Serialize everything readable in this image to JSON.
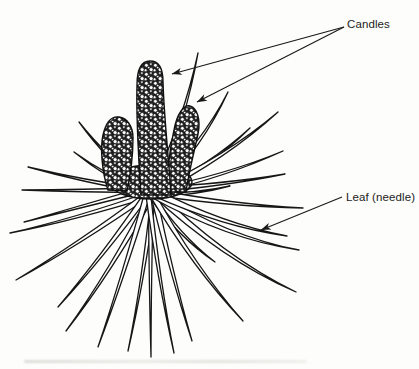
{
  "diagram": {
    "callouts": [
      {
        "label": "Candles",
        "arrow_count": 2
      },
      {
        "label": "Leaf (needle)",
        "arrow_count": 1
      }
    ]
  },
  "figure": {
    "center": [
      151,
      192
    ],
    "needles": [
      {
        "tip": [
          198,
          53
        ],
        "w": 6,
        "sag": 7,
        "off": 2
      },
      {
        "tip": [
          228,
          92
        ],
        "w": 6,
        "sag": 9,
        "off": 3
      },
      {
        "tip": [
          250,
          128
        ],
        "w": 5,
        "sag": 6,
        "off": 4
      },
      {
        "tip": [
          278,
          112
        ],
        "w": 6,
        "sag": 9,
        "off": 2
      },
      {
        "tip": [
          283,
          151
        ],
        "w": 5,
        "sag": 7,
        "off": 0
      },
      {
        "tip": [
          285,
          174
        ],
        "w": 5,
        "sag": 5,
        "off": -2
      },
      {
        "tip": [
          230,
          186
        ],
        "w": 4,
        "sag": 3,
        "off": 3
      },
      {
        "tip": [
          303,
          208
        ],
        "w": 6,
        "sag": 5,
        "off": 0
      },
      {
        "tip": [
          79,
          122
        ],
        "w": 5,
        "sag": -5,
        "off": -2
      },
      {
        "tip": [
          74,
          152
        ],
        "w": 5,
        "sag": -3,
        "off": -4
      },
      {
        "tip": [
          28,
          167
        ],
        "w": 5,
        "sag": -3,
        "off": 0
      },
      {
        "tip": [
          22,
          190
        ],
        "w": 5,
        "sag": -2,
        "off": 2
      },
      {
        "tip": [
          10,
          233
        ],
        "w": 5,
        "sag": -3,
        "off": -2
      },
      {
        "tip": [
          24,
          222
        ],
        "w": 5,
        "sag": -2,
        "off": 4
      },
      {
        "tip": [
          16,
          280
        ],
        "w": 6,
        "sag": -4,
        "off": 0
      },
      {
        "tip": [
          58,
          307
        ],
        "w": 6,
        "sag": -5,
        "off": 2
      },
      {
        "tip": [
          66,
          331
        ],
        "w": 6,
        "sag": -5,
        "off": -2
      },
      {
        "tip": [
          98,
          347
        ],
        "w": 6,
        "sag": -4,
        "off": 3
      },
      {
        "tip": [
          128,
          351
        ],
        "w": 5,
        "sag": -2,
        "off": -3
      },
      {
        "tip": [
          151,
          357
        ],
        "w": 5,
        "sag": 1,
        "off": 0
      },
      {
        "tip": [
          174,
          353
        ],
        "w": 5,
        "sag": 2,
        "off": 3
      },
      {
        "tip": [
          192,
          341
        ],
        "w": 6,
        "sag": 4,
        "off": -2
      },
      {
        "tip": [
          215,
          262
        ],
        "w": 5,
        "sag": 7,
        "off": 2
      },
      {
        "tip": [
          243,
          321
        ],
        "w": 6,
        "sag": 9,
        "off": 0
      },
      {
        "tip": [
          296,
          292
        ],
        "w": 7,
        "sag": 16,
        "off": -2
      },
      {
        "tip": [
          299,
          250
        ],
        "w": 7,
        "sag": 14,
        "off": 1
      },
      {
        "tip": [
          287,
          236
        ],
        "w": 7,
        "sag": 11,
        "off": -1
      }
    ],
    "arrows": [
      {
        "name": "candles-arrow-1",
        "from": [
          344,
          27
        ],
        "to": [
          172,
          74
        ]
      },
      {
        "name": "candles-arrow-2",
        "from": [
          344,
          27
        ],
        "to": [
          197,
          102
        ]
      },
      {
        "name": "leaf-arrow",
        "from": [
          342,
          197
        ],
        "to": [
          261,
          230
        ]
      }
    ]
  },
  "colors": {
    "ink": "#1a1a1a",
    "paper": "#fdfdfb"
  }
}
